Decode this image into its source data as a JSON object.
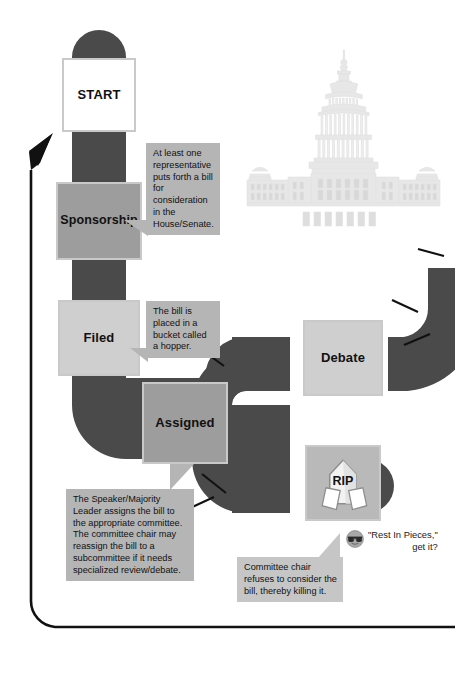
{
  "diagram": {
    "title": "How a Bill Becomes a Law (partial flowchart)",
    "colors": {
      "page_background": "#ffffff",
      "track_dark": "#4a4a4a",
      "node_start_fill": "#ffffff",
      "node_mid_fill": "#9d9d9d",
      "node_light_fill": "#cfcfcf",
      "node_border": "#c9c9c9",
      "callout_fill": "#b5b5b5",
      "callout_fill_pale": "#c6c6c6",
      "return_line": "#111111",
      "capitol_watermark": "#e9e9e9",
      "text": "#111111"
    }
  },
  "nodes": [
    {
      "id": "start",
      "label": "START"
    },
    {
      "id": "sponsorship",
      "label": "Sponsorship"
    },
    {
      "id": "filed",
      "label": "Filed"
    },
    {
      "id": "assigned",
      "label": "Assigned"
    },
    {
      "id": "debate",
      "label": "Debate"
    },
    {
      "id": "rip",
      "label": "RIP"
    }
  ],
  "callouts": [
    {
      "id": "sponsorship-note",
      "text": "At least one representative puts forth a bill for consideration in the House/Senate."
    },
    {
      "id": "filed-note",
      "text": "The bill is placed in a bucket called a hopper."
    },
    {
      "id": "assigned-note",
      "text": "The Speaker/Majority Leader assigns the bill to the appropriate committee. The committee chair may reassign the bill to a subcommittee if it needs specialized review/debate."
    },
    {
      "id": "rip-note",
      "text": "Committee chair refuses to consider the bill, thereby killing it."
    }
  ],
  "annotations": {
    "rip_joke": {
      "icon": "sunglasses-face-icon",
      "text": "\"Rest In Pieces,\"\nget it?"
    }
  },
  "illustrations": {
    "capitol": "us-capitol-building-watermark"
  }
}
